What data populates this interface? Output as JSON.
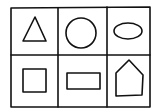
{
  "diagram": {
    "type": "shape-grid",
    "rows": 2,
    "columns": 3,
    "stroke_color": "#111111",
    "background": "#ffffff",
    "cells": [
      {
        "row": 0,
        "col": 0,
        "shape": "triangle"
      },
      {
        "row": 0,
        "col": 1,
        "shape": "circle"
      },
      {
        "row": 0,
        "col": 2,
        "shape": "ellipse"
      },
      {
        "row": 1,
        "col": 0,
        "shape": "square"
      },
      {
        "row": 1,
        "col": 1,
        "shape": "rectangle"
      },
      {
        "row": 1,
        "col": 2,
        "shape": "pentagon"
      }
    ]
  }
}
